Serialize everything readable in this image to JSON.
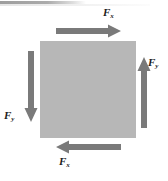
{
  "figure": {
    "colors": {
      "body_fill": "#b7b7b7",
      "arrow": "#7a7a7a",
      "label_text": "#1c1c1c",
      "background": "#ffffff"
    },
    "body": {
      "shape": "square",
      "x": 40,
      "y": 41,
      "width": 96,
      "height": 97
    },
    "arrows": [
      {
        "id": "arrow-fx-top",
        "direction": "right",
        "x": 56,
        "y": 30,
        "length": 64,
        "thickness": 5
      },
      {
        "id": "arrow-fx-bottom",
        "direction": "left",
        "x": 56,
        "y": 146,
        "length": 64,
        "thickness": 5
      },
      {
        "id": "arrow-fy-right",
        "direction": "up",
        "x": 142,
        "y": 57,
        "length": 70,
        "thickness": 5
      },
      {
        "id": "arrow-fy-left",
        "direction": "down",
        "x": 30,
        "y": 51,
        "length": 70,
        "thickness": 5
      }
    ],
    "labels": {
      "fx_top": {
        "symbol": "F",
        "subscript": "x"
      },
      "fx_bottom": {
        "symbol": "F",
        "subscript": "x"
      },
      "fy_right": {
        "symbol": "F",
        "subscript": "y"
      },
      "fy_left": {
        "symbol": "F",
        "subscript": "y"
      }
    }
  }
}
